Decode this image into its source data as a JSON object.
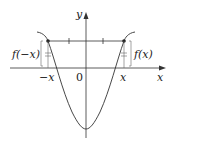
{
  "diagram": {
    "axes": {
      "x_label": "x",
      "y_label": "y",
      "origin_label": "0"
    },
    "ticks": {
      "neg_x": "−x",
      "pos_x": "x"
    },
    "annotations": {
      "left": "f(−x)",
      "right": "f(x)"
    },
    "colors": {
      "line": "#333333",
      "background": "#ffffff"
    }
  }
}
